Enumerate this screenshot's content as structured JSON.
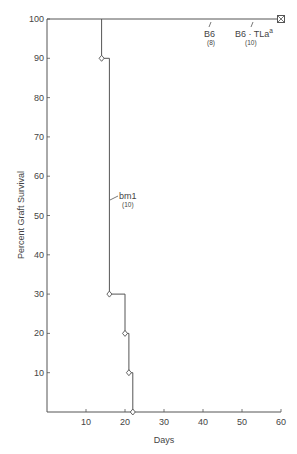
{
  "chart_data": {
    "type": "line",
    "subtype": "kaplan-meier step survival",
    "title": "",
    "xlabel": "Days",
    "ylabel": "Percent Graft Survival",
    "xlim": [
      0,
      60
    ],
    "ylim": [
      0,
      100
    ],
    "x_ticks": [
      10,
      20,
      30,
      40,
      50,
      60
    ],
    "y_ticks": [
      10,
      20,
      30,
      40,
      50,
      60,
      70,
      80,
      90,
      100
    ],
    "grid": false,
    "legend": "none (inline annotations)",
    "series": [
      {
        "name": "B6",
        "n": "(8)",
        "points": [
          {
            "x": 0,
            "y": 100
          },
          {
            "x": 60,
            "y": 100
          }
        ],
        "marker_at_end": "square"
      },
      {
        "name": "B6 · TLa",
        "name_superscript": "a",
        "n": "(10)",
        "points": [
          {
            "x": 0,
            "y": 100
          },
          {
            "x": 60,
            "y": 100
          }
        ],
        "marker_at_end": "square"
      },
      {
        "name": "bm1",
        "n": "(10)",
        "steps": [
          {
            "x": 0,
            "y": 100
          },
          {
            "x": 14,
            "y": 90
          },
          {
            "x": 16,
            "y": 30
          },
          {
            "x": 20,
            "y": 20
          },
          {
            "x": 21,
            "y": 10
          },
          {
            "x": 22,
            "y": 0
          }
        ],
        "markers": "open diamonds at each step"
      }
    ]
  },
  "labels": {
    "b6": "B6",
    "b6_n": "(8)",
    "b6tla": "B6 · TLa",
    "b6tla_sup": "a",
    "b6tla_n": "(10)",
    "bm1": "bm1",
    "bm1_n": "(10)"
  },
  "colors": {
    "line": "#555555",
    "text": "#444444",
    "background": "#ffffff"
  }
}
